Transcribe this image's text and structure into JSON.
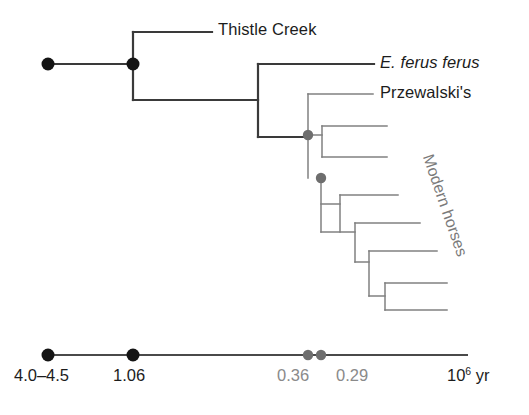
{
  "figure": {
    "type": "phylogenetic-tree",
    "title": "",
    "background_color": "#ffffff",
    "branch_color_main": "#3a3a3a",
    "branch_color_clade": "#808080",
    "node_color_black": "#141414",
    "node_color_grey": "#6e6e6e",
    "axis_color": "#4a4a4a"
  },
  "tips": [
    {
      "id": "thistle-creek",
      "label": "Thistle Creek",
      "italic": false,
      "x": 218,
      "y": 32
    },
    {
      "id": "e-ferus-ferus",
      "label": "E. ferus ferus",
      "italic": true,
      "x": 380,
      "y": 65
    },
    {
      "id": "przewalskis",
      "label": "Przewalski's",
      "italic": false,
      "x": 380,
      "y": 95
    }
  ],
  "clade_labels": [
    {
      "id": "modern-horses",
      "label": "Modern horses",
      "x": 436,
      "y": 152,
      "rotation_deg": 71,
      "color": "#7a7a7a"
    }
  ],
  "nodes": [
    {
      "id": "root",
      "x": 48,
      "y": 64,
      "color": "black",
      "radius": 6.5
    },
    {
      "id": "split-1.06",
      "x": 133,
      "y": 64,
      "color": "black",
      "radius": 6.5
    },
    {
      "id": "split-0.36",
      "x": 308,
      "y": 135,
      "color": "grey",
      "radius": 5.2
    },
    {
      "id": "split-0.29",
      "x": 321,
      "y": 178,
      "color": "grey",
      "radius": 5.2
    }
  ],
  "axis": {
    "line_start_x": 48,
    "line_end_x": 468,
    "line_y": 355,
    "ticks": [
      {
        "id": "tick-4.0-4.5",
        "label": "4.0–4.5",
        "x": 48,
        "color": "black",
        "radius": 6.5,
        "label_x": 14,
        "label_y": 366
      },
      {
        "id": "tick-1.06",
        "label": "1.06",
        "x": 133,
        "color": "black",
        "radius": 6.5,
        "label_x": 113,
        "label_y": 366
      },
      {
        "id": "tick-0.36",
        "label": "0.36",
        "x": 308,
        "color": "grey",
        "radius": 5.2,
        "label_x": 277,
        "label_y": 366
      },
      {
        "id": "tick-0.29",
        "label": "0.29",
        "x": 321,
        "color": "grey",
        "radius": 5.2,
        "label_x": 336,
        "label_y": 366
      }
    ],
    "unit_label": "10",
    "unit_exponent": "6",
    "unit_suffix": " yr",
    "unit_x": 447,
    "unit_y": 366
  },
  "branches": {
    "main": [
      {
        "id": "root-stem",
        "x1": 48,
        "y1": 64,
        "x2": 133,
        "y2": 64
      },
      {
        "id": "node1-vertical",
        "x1": 133,
        "y1": 32,
        "x2": 133,
        "y2": 100
      },
      {
        "id": "thistle-creek-branch",
        "x1": 133,
        "y1": 32,
        "x2": 212,
        "y2": 32
      },
      {
        "id": "lower-clade-stem",
        "x1": 133,
        "y1": 100,
        "x2": 258,
        "y2": 100
      },
      {
        "id": "node2-vertical",
        "x1": 258,
        "y1": 64,
        "x2": 258,
        "y2": 137
      },
      {
        "id": "e-ferus-branch",
        "x1": 258,
        "y1": 64,
        "x2": 374,
        "y2": 64
      },
      {
        "id": "node2-to-grey1",
        "x1": 258,
        "y1": 137,
        "x2": 308,
        "y2": 137
      }
    ],
    "clade": [
      {
        "id": "grey1-vertical",
        "x1": 308,
        "y1": 94,
        "x2": 308,
        "y2": 178
      },
      {
        "id": "przewalski-branch",
        "x1": 308,
        "y1": 94,
        "x2": 373,
        "y2": 94
      },
      {
        "id": "cherry1-stem",
        "x1": 308,
        "y1": 135,
        "x2": 322,
        "y2": 135
      },
      {
        "id": "cherry1-vertical",
        "x1": 322,
        "y1": 126,
        "x2": 322,
        "y2": 157
      },
      {
        "id": "cherry1-tip-a",
        "x1": 322,
        "y1": 126,
        "x2": 387,
        "y2": 126
      },
      {
        "id": "cherry1-tip-b",
        "x1": 322,
        "y1": 157,
        "x2": 387,
        "y2": 157
      },
      {
        "id": "grey2-ladder-vertical",
        "x1": 321,
        "y1": 178,
        "x2": 321,
        "y2": 232
      },
      {
        "id": "ladder1-stem",
        "x1": 321,
        "y1": 204,
        "x2": 340,
        "y2": 204
      },
      {
        "id": "ladder1-vertical",
        "x1": 340,
        "y1": 195,
        "x2": 340,
        "y2": 232
      },
      {
        "id": "ladder1-tip",
        "x1": 340,
        "y1": 195,
        "x2": 398,
        "y2": 195
      },
      {
        "id": "ladder2-stem",
        "x1": 321,
        "y1": 232,
        "x2": 355,
        "y2": 232
      },
      {
        "id": "ladder2-vertical",
        "x1": 355,
        "y1": 223,
        "x2": 355,
        "y2": 262
      },
      {
        "id": "ladder2-tip",
        "x1": 355,
        "y1": 223,
        "x2": 420,
        "y2": 223
      },
      {
        "id": "ladder3-vertical",
        "x1": 369,
        "y1": 251,
        "x2": 369,
        "y2": 296
      },
      {
        "id": "ladder3-stem",
        "x1": 355,
        "y1": 262,
        "x2": 369,
        "y2": 262
      },
      {
        "id": "ladder3-tip",
        "x1": 369,
        "y1": 251,
        "x2": 437,
        "y2": 251
      },
      {
        "id": "cherry2-stem",
        "x1": 369,
        "y1": 296,
        "x2": 385,
        "y2": 296
      },
      {
        "id": "cherry2-vertical",
        "x1": 385,
        "y1": 283,
        "x2": 385,
        "y2": 310
      },
      {
        "id": "cherry2-tip-a",
        "x1": 385,
        "y1": 283,
        "x2": 447,
        "y2": 283
      },
      {
        "id": "cherry2-tip-b",
        "x1": 385,
        "y1": 310,
        "x2": 447,
        "y2": 310
      }
    ]
  }
}
